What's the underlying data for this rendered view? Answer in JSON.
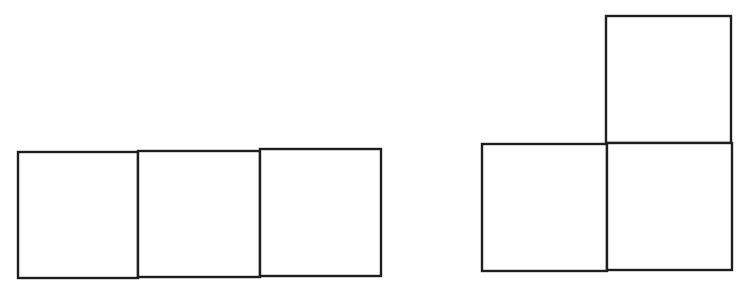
{
  "diagram": {
    "stroke_color": "#1e1e1e",
    "background": "#ffffff",
    "figures": [
      {
        "name": "row-of-three-squares",
        "cells": [
          {
            "x": 18,
            "y": 152,
            "w": 120,
            "h": 126
          },
          {
            "x": 138,
            "y": 151,
            "w": 122,
            "h": 126
          },
          {
            "x": 260,
            "y": 149,
            "w": 121,
            "h": 127
          }
        ]
      },
      {
        "name": "l-shape-three-squares",
        "cells": [
          {
            "x": 606,
            "y": 16,
            "w": 125,
            "h": 127
          },
          {
            "x": 482,
            "y": 144,
            "w": 125,
            "h": 127
          },
          {
            "x": 607,
            "y": 143,
            "w": 125,
            "h": 127
          }
        ]
      }
    ]
  }
}
